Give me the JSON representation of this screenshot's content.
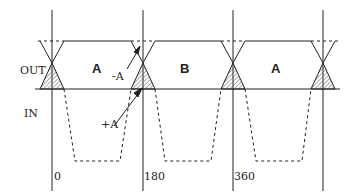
{
  "diagram": {
    "axis_labels": {
      "out": "OUT",
      "in": "IN"
    },
    "region_labels": [
      "A",
      "B",
      "A"
    ],
    "annotations": {
      "minus_a": "-A",
      "plus_a": "+A"
    },
    "tick_labels": [
      "0",
      "180",
      "360"
    ],
    "colors": {
      "line": "#222222",
      "hatch": "#555555",
      "background": "#ffffff"
    },
    "lines": {
      "verticals_x": [
        52,
        143,
        233,
        323
      ],
      "top_level_y": 41,
      "baseline_y": 89,
      "crossing_y": 63,
      "in_bottom_y": 161
    }
  }
}
